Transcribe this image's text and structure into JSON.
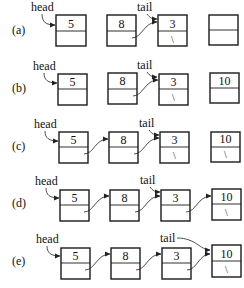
{
  "diagram": {
    "pointer_labels": {
      "head": "head",
      "tail": "tail"
    },
    "null_symbol": "\\",
    "rows": [
      {
        "label": "(a)",
        "nodes": [
          {
            "value": "5",
            "next": ""
          },
          {
            "value": "8",
            "next": ""
          },
          {
            "value": "3",
            "next": "\\"
          },
          {
            "value": "",
            "next": ""
          }
        ],
        "links": [
          "1->2"
        ],
        "head": 0,
        "tail": 2
      },
      {
        "label": "(b)",
        "nodes": [
          {
            "value": "5",
            "next": ""
          },
          {
            "value": "8",
            "next": ""
          },
          {
            "value": "3",
            "next": "\\"
          },
          {
            "value": "10",
            "next": ""
          }
        ],
        "links": [
          "1->2"
        ],
        "head": 0,
        "tail": 2
      },
      {
        "label": "(c)",
        "nodes": [
          {
            "value": "5",
            "next": ""
          },
          {
            "value": "8",
            "next": ""
          },
          {
            "value": "3",
            "next": "\\"
          },
          {
            "value": "10",
            "next": "\\"
          }
        ],
        "links": [
          "0->1",
          "1->2"
        ],
        "head": 0,
        "tail": 2
      },
      {
        "label": "(d)",
        "nodes": [
          {
            "value": "5",
            "next": ""
          },
          {
            "value": "8",
            "next": ""
          },
          {
            "value": "3",
            "next": ""
          },
          {
            "value": "10",
            "next": "\\"
          }
        ],
        "links": [
          "0->1",
          "1->2",
          "2->3"
        ],
        "head": 0,
        "tail": 2
      },
      {
        "label": "(e)",
        "nodes": [
          {
            "value": "5",
            "next": ""
          },
          {
            "value": "8",
            "next": ""
          },
          {
            "value": "3",
            "next": ""
          },
          {
            "value": "10",
            "next": "\\"
          }
        ],
        "links": [
          "0->1",
          "1->2",
          "2->3"
        ],
        "head": 0,
        "tail": 3
      }
    ]
  }
}
